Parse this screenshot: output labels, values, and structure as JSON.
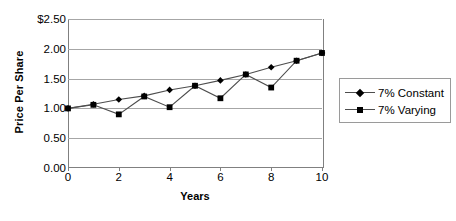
{
  "chart_data": {
    "type": "line",
    "title": "",
    "xlabel": "Years",
    "ylabel": "Price Per Share",
    "xlim": [
      0,
      10
    ],
    "ylim": [
      0,
      2.5
    ],
    "grid": true,
    "legend_position": "right",
    "x": [
      0,
      1,
      2,
      3,
      4,
      5,
      6,
      7,
      8,
      9,
      10
    ],
    "x_tick_labels": [
      "0",
      "2",
      "4",
      "6",
      "8",
      "10"
    ],
    "x_tick_values": [
      0,
      2,
      4,
      6,
      8,
      10
    ],
    "y_tick_labels": [
      "$2.50",
      "2.00",
      "1.50",
      "1.00",
      "0.50",
      "0.00"
    ],
    "y_tick_values": [
      2.5,
      2.0,
      1.5,
      1.0,
      0.5,
      0.0
    ],
    "series": [
      {
        "name": "7% Constant",
        "marker": "diamond",
        "values": [
          1.0,
          1.07,
          1.15,
          1.21,
          1.31,
          1.38,
          1.47,
          1.57,
          1.69,
          1.8,
          1.93
        ]
      },
      {
        "name": "7% Varying",
        "marker": "square",
        "values": [
          1.0,
          1.06,
          0.9,
          1.2,
          1.02,
          1.38,
          1.17,
          1.57,
          1.35,
          1.8,
          1.93
        ]
      }
    ]
  },
  "legend": {
    "items": [
      {
        "label": "7% Constant"
      },
      {
        "label": "7% Varying"
      }
    ]
  },
  "axes": {
    "y_title": "Price Per Share",
    "x_title": "Years"
  },
  "colors": {
    "series_line": "#4d4d4d",
    "marker": "#000000",
    "gridline": "#a6a6a6",
    "axis": "#808080",
    "background": "#ffffff"
  }
}
